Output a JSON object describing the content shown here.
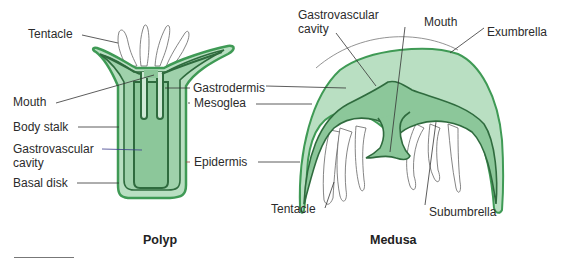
{
  "colors": {
    "outer_light": "#b9dfc2",
    "mid_green": "#8cc79a",
    "dark_outline": "#2f6b3e",
    "bright_outline": "#3f9a55",
    "tentacle_stroke": "#555555",
    "leader_line": "#333333",
    "epidermis_leader": "#a04040",
    "cavity_leader": "#3a3a8a"
  },
  "polyp": {
    "title": "Polyp",
    "labels": {
      "tentacle": "Tentacle",
      "mouth": "Mouth",
      "body_stalk": "Body stalk",
      "gastrovascular_cavity_line1": "Gastrovascular",
      "gastrovascular_cavity_line2": "cavity",
      "basal_disk": "Basal disk"
    }
  },
  "shared_labels": {
    "gastrodermis": "Gastrodermis",
    "mesoglea": "Mesoglea",
    "epidermis": "Epidermis"
  },
  "medusa": {
    "title": "Medusa",
    "labels": {
      "gastrovascular_cavity_line1": "Gastrovascular",
      "gastrovascular_cavity_line2": "cavity",
      "mouth": "Mouth",
      "exumbrella": "Exumbrella",
      "tentacle": "Tentacle",
      "subumbrella": "Subumbrella"
    }
  }
}
